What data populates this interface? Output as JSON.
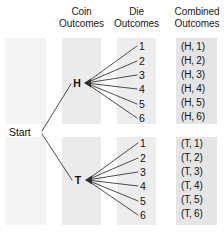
{
  "diagram": {
    "title_hidden": "",
    "type": "probability-tree-diagram",
    "width": 224,
    "height": 234,
    "background_color": "#ffffff",
    "line_color": "#333333",
    "text_color": "#111111"
  },
  "columns": [
    {
      "key": "start",
      "header_line1": "",
      "header_line2": "",
      "band": {
        "x": 5,
        "w": 41,
        "fill": "#f2f2f2"
      }
    },
    {
      "key": "coin",
      "header_line1": "Coin",
      "header_line2": "Outcomes",
      "band": {
        "x": 62,
        "w": 39,
        "fill": "#ebebeb"
      }
    },
    {
      "key": "die",
      "header_line1": "Die",
      "header_line2": "Outcomes",
      "band": {
        "x": 117,
        "w": 39,
        "fill": "#ececec"
      }
    },
    {
      "key": "combined",
      "header_line1": "Combined",
      "header_line2": "Outcomes",
      "band": {
        "x": 176,
        "w": 41,
        "fill": "#e4e4e4"
      }
    }
  ],
  "start": {
    "label": "Start"
  },
  "branches": [
    {
      "key": "heads",
      "node_label": "H",
      "die_outcomes": [
        "1",
        "2",
        "3",
        "4",
        "5",
        "6"
      ],
      "combined_outcomes": [
        "(H, 1)",
        "(H, 2)",
        "(H, 3)",
        "(H, 4)",
        "(H, 5)",
        "(H, 6)"
      ]
    },
    {
      "key": "tails",
      "node_label": "T",
      "die_outcomes": [
        "1",
        "2",
        "3",
        "4",
        "5",
        "6"
      ],
      "combined_outcomes": [
        "(T, 1)",
        "(T, 2)",
        "(T, 3)",
        "(T, 4)",
        "(T, 5)",
        "(T, 6)"
      ]
    }
  ]
}
